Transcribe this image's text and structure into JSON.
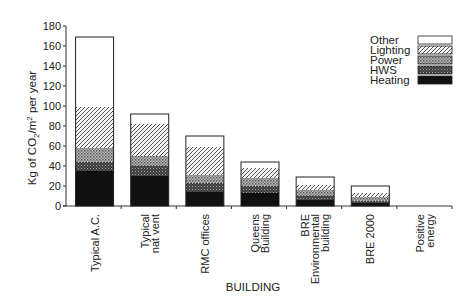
{
  "chart_data": {
    "type": "bar",
    "stacked": true,
    "title": "",
    "xlabel": "BUILDING",
    "ylabel": "Kg of CO₂/m² per year",
    "ylim": [
      0,
      180
    ],
    "yticks": [
      0,
      20,
      40,
      60,
      80,
      100,
      120,
      140,
      160,
      180
    ],
    "grid": false,
    "legend_position": "upper right",
    "categories": [
      [
        "Typical A.C."
      ],
      [
        "Typical",
        "nat vent"
      ],
      [
        "RMC offices"
      ],
      [
        "Queens",
        "Building"
      ],
      [
        "BRE",
        "Environmental",
        "building"
      ],
      [
        "BRE 2000"
      ],
      [
        "Positive",
        "energy"
      ]
    ],
    "category_names": [
      "Typical A.C.",
      "Typical nat vent",
      "RMC offices",
      "Queens Building",
      "BRE Environmental building",
      "BRE 2000",
      "Positive energy"
    ],
    "series": [
      {
        "name": "Heating",
        "pattern": "solid-black",
        "values": [
          35,
          30,
          14,
          13,
          6,
          3,
          0
        ]
      },
      {
        "name": "HWS",
        "pattern": "dense-check",
        "values": [
          9,
          10,
          9,
          7,
          4,
          2,
          0
        ]
      },
      {
        "name": "Power",
        "pattern": "crosshatch",
        "values": [
          14,
          10,
          8,
          8,
          6,
          4,
          0
        ]
      },
      {
        "name": "Lighting",
        "pattern": "diagonal",
        "values": [
          41,
          32,
          28,
          10,
          5,
          4,
          0
        ]
      },
      {
        "name": "Other",
        "pattern": "white",
        "values": [
          70,
          10,
          11,
          6,
          8,
          7,
          0
        ]
      }
    ],
    "totals": [
      169,
      92,
      70,
      44,
      29,
      20,
      0
    ],
    "legend_order": [
      "Other",
      "Lighting",
      "Power",
      "HWS",
      "Heating"
    ]
  }
}
